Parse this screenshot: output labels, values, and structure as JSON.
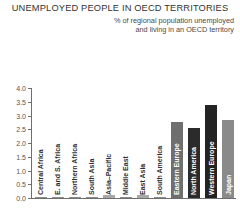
{
  "header": {
    "title": "UNEMPLOYED PEOPLE IN OECD TERRITORIES",
    "subtitle_line1": "% of regional population unemployed",
    "subtitle_line2": "and living in an OECD territory"
  },
  "chart_data": {
    "type": "bar",
    "title": "UNEMPLOYED PEOPLE IN OECD TERRITORIES",
    "subtitle": "% of regional population unemployed and living in an OECD territory",
    "xlabel": "",
    "ylabel": "",
    "ylim": [
      0.0,
      4.0
    ],
    "ytick_labels": [
      "0.0",
      "0.5",
      "1.0",
      "1.5",
      "2.0",
      "2.5",
      "3.0",
      "3.5",
      "4.0"
    ],
    "ytick_values": [
      0.0,
      0.5,
      1.0,
      1.5,
      2.0,
      2.5,
      3.0,
      3.5,
      4.0
    ],
    "grid": false,
    "legend": false,
    "orientation": "vertical",
    "categories": [
      "Central Africa",
      "E. and S. Africa",
      "Northern Africa",
      "South Asia",
      "Asia–Pacific",
      "Middle East",
      "East Asia",
      "South America",
      "Eastern Europe",
      "North America",
      "Western Europe",
      "Japan"
    ],
    "values": [
      0.02,
      0.02,
      0.03,
      0.03,
      0.12,
      0.04,
      0.1,
      0.04,
      2.75,
      2.55,
      3.4,
      2.85
    ],
    "bar_colors": [
      "#8c8c8c",
      "#8c8c8c",
      "#8c8c8c",
      "#8c8c8c",
      "#a8a8a8",
      "#8c8c8c",
      "#a8a8a8",
      "#8c8c8c",
      "#6f6f6f",
      "#2b2b2b",
      "#232323",
      "#8a8a8a"
    ],
    "label_inside": [
      false,
      false,
      false,
      false,
      false,
      false,
      false,
      false,
      true,
      true,
      true,
      true
    ]
  },
  "colors": {
    "axis": "#6e6e6e",
    "text": "#333333",
    "background": "#ffffff"
  }
}
